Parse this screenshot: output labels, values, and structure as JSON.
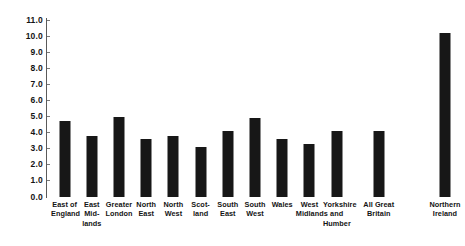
{
  "chart_data": {
    "type": "bar",
    "title": "",
    "xlabel": "",
    "ylabel": "",
    "ylim": [
      0.0,
      11.0
    ],
    "ytick_step": 1.0,
    "grid": false,
    "legend": "none",
    "bar_color": "#171717",
    "axis_color": "#5a5a5a",
    "categories": [
      "East of England",
      "East Mid-lands",
      "Greater London",
      "North East",
      "North West",
      "Scot-land",
      "South East",
      "South West",
      "Wales",
      "West Midlands",
      "Yorkshire and Humber",
      "All Great Britain",
      "Northern Ireland"
    ],
    "category_lines": [
      [
        "East of",
        "England"
      ],
      [
        "East",
        "Mid-",
        "lands"
      ],
      [
        "Greater",
        "London"
      ],
      [
        "North",
        "East"
      ],
      [
        "North",
        "West"
      ],
      [
        "Scot-",
        "land"
      ],
      [
        "South",
        "East"
      ],
      [
        "South",
        "West"
      ],
      [
        "Wales"
      ],
      [
        "West",
        "Midlands"
      ],
      [
        "Yorkshire",
        "and",
        "Humber"
      ],
      [
        "All Great",
        "Britain"
      ],
      [
        "Northern",
        "Ireland"
      ]
    ],
    "values": [
      4.7,
      3.8,
      5.0,
      3.6,
      3.8,
      3.1,
      4.1,
      4.9,
      3.6,
      3.3,
      4.1,
      4.1,
      10.2
    ],
    "ytick_labels": [
      "11.0",
      "10.0",
      "9.0",
      "8.0",
      "7.0",
      "6.0",
      "5.0",
      "4.0",
      "3.0",
      "2.0",
      "1.0",
      "0.0"
    ],
    "ytick_values": [
      11.0,
      10.0,
      9.0,
      8.0,
      7.0,
      6.0,
      5.0,
      4.0,
      3.0,
      2.0,
      1.0,
      0.0
    ]
  }
}
